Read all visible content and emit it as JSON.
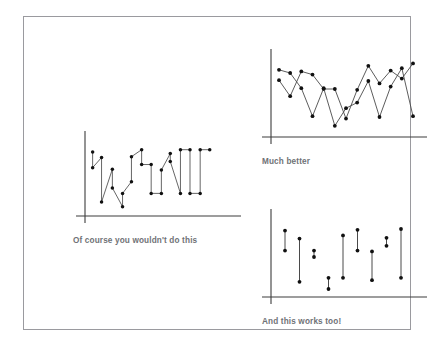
{
  "slide": {
    "background": "#ffffff",
    "frame_border_color": "#9a9a9f",
    "width": 439,
    "height": 347
  },
  "style": {
    "axis_color": "#3c3c3c",
    "line_color": "#4a4a4a",
    "marker_color": "#111111",
    "caption_color": "#6f7276"
  },
  "panels": [
    {
      "id": "bad",
      "name": "connected-scatter-bad",
      "caption": "Of course you wouldn't do this"
    },
    {
      "id": "better",
      "name": "line-chart-better",
      "caption": "Much better"
    },
    {
      "id": "range",
      "name": "range-dumbbell-chart",
      "caption": "And this works too!"
    }
  ],
  "chart_data": [
    {
      "type": "scatter",
      "id": "bad",
      "title": "Of course you wouldn't do this",
      "subtitle": "",
      "xlabel": "",
      "ylabel": "",
      "grid": false,
      "legend": "none",
      "note": "Connected scatter drawn in data order; points connected by straight segments producing a tangled zig-zag path.",
      "xlim": [
        0,
        22
      ],
      "ylim": [
        0,
        10
      ],
      "series": [
        {
          "name": "series-1",
          "connected": true,
          "x": [
            1.2,
            1.2,
            2.6,
            2.6,
            4.3,
            4.3,
            5.9,
            5.9,
            7.3,
            7.3,
            8.9,
            8.9,
            10.4,
            10.4,
            12.0,
            12.0,
            13.4,
            13.4,
            15.0,
            15.0,
            16.5,
            16.5,
            18.1,
            18.1,
            19.6
          ],
          "y": [
            8.2,
            6.2,
            7.5,
            1.8,
            6.0,
            3.6,
            1.2,
            2.9,
            4.4,
            7.6,
            8.5,
            6.6,
            6.6,
            2.9,
            2.9,
            5.9,
            8.0,
            7.0,
            2.9,
            8.5,
            8.5,
            2.9,
            2.9,
            8.5,
            8.5
          ]
        }
      ],
      "points": [
        [
          1.2,
          8.2
        ],
        [
          1.2,
          6.2
        ],
        [
          2.6,
          7.5
        ],
        [
          2.6,
          1.8
        ],
        [
          4.3,
          6.0
        ],
        [
          4.3,
          3.6
        ],
        [
          5.9,
          1.2
        ],
        [
          5.9,
          2.9
        ],
        [
          7.3,
          4.4
        ],
        [
          7.3,
          7.6
        ],
        [
          8.9,
          8.5
        ],
        [
          8.9,
          6.6
        ],
        [
          10.4,
          6.6
        ],
        [
          10.4,
          2.9
        ],
        [
          12.0,
          2.9
        ],
        [
          12.0,
          5.9
        ],
        [
          13.4,
          8.0
        ],
        [
          13.4,
          7.0
        ],
        [
          15.0,
          2.9
        ],
        [
          15.0,
          8.5
        ],
        [
          16.5,
          8.5
        ],
        [
          16.5,
          2.9
        ],
        [
          18.1,
          2.9
        ],
        [
          18.1,
          8.5
        ],
        [
          19.6,
          8.5
        ]
      ]
    },
    {
      "type": "line",
      "id": "better",
      "title": "Much better",
      "subtitle": "",
      "xlabel": "",
      "ylabel": "",
      "grid": false,
      "legend": "none",
      "note": "Two overlapping line series with circular markers.",
      "xlim": [
        0,
        14
      ],
      "ylim": [
        0,
        10
      ],
      "categories": [
        1,
        2,
        3,
        4,
        5,
        6,
        7,
        8,
        9,
        10,
        11,
        12,
        13
      ],
      "series": [
        {
          "name": "series-a",
          "values": [
            7.1,
            5.1,
            8.2,
            7.8,
            6.0,
            6.0,
            2.3,
            5.9,
            8.9,
            6.7,
            8.3,
            7.3,
            9.2
          ]
        },
        {
          "name": "series-b",
          "values": [
            8.4,
            8.0,
            6.1,
            2.6,
            6.1,
            1.4,
            3.6,
            4.3,
            7.0,
            2.5,
            6.3,
            8.6,
            2.6
          ]
        }
      ]
    },
    {
      "type": "range",
      "id": "range",
      "title": "And this works too!",
      "subtitle": "",
      "xlabel": "",
      "ylabel": "",
      "grid": false,
      "legend": "none",
      "note": "Dumbbell / range plot: nine vertical segments each capped by two dots (low and high value).",
      "xlim": [
        0,
        10
      ],
      "ylim": [
        0,
        10
      ],
      "categories": [
        1,
        2,
        3,
        4,
        5,
        6,
        7,
        8,
        9
      ],
      "low": [
        5.8,
        1.9,
        5.0,
        1.0,
        2.4,
        5.8,
        2.1,
        6.4,
        2.4
      ],
      "high": [
        8.3,
        7.3,
        5.8,
        2.4,
        7.7,
        8.4,
        5.7,
        7.4,
        8.5
      ]
    }
  ]
}
